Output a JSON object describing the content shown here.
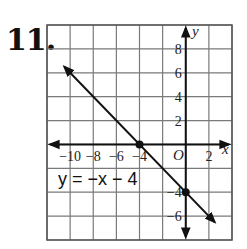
{
  "problem": {
    "number": "11."
  },
  "chart_data": {
    "type": "line",
    "title": "",
    "xlabel": "x",
    "ylabel": "y",
    "xlim": [
      -12,
      4
    ],
    "ylim": [
      -8,
      10
    ],
    "grid": true,
    "grid_step": 2,
    "x_tick_labels": [
      "−10",
      "−8",
      "−6",
      "−4",
      "2"
    ],
    "y_tick_labels": [
      "8",
      "6",
      "4",
      "2",
      "−4",
      "−6"
    ],
    "origin_label": "O",
    "series": [
      {
        "name": "y = −x − 4",
        "equation": "y = -x - 4",
        "slope": -1,
        "intercept": -4,
        "x": [
          -10.5,
          2.5
        ],
        "y": [
          6.5,
          -6.5
        ],
        "arrows_both_ends": true
      }
    ],
    "points": [
      {
        "label": "x-intercept",
        "x": -4,
        "y": 0
      },
      {
        "label": "y-intercept",
        "x": 0,
        "y": -4
      }
    ],
    "annotation": "y = −x − 4",
    "colors": {
      "line": "#111111",
      "grid": "#7a7a7a",
      "axis": "#111111"
    }
  }
}
